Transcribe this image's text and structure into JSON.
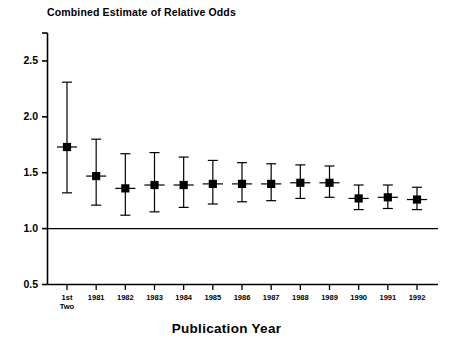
{
  "chart_data": {
    "type": "scatter",
    "title": "Combined Estimate of Relative Odds",
    "xlabel": "Publication Year",
    "ylabel": "",
    "categories": [
      "1st\nTwo",
      "1981",
      "1982",
      "1983",
      "1984",
      "1985",
      "1986",
      "1987",
      "1988",
      "1989",
      "1990",
      "1991",
      "1992"
    ],
    "category_labels": [
      {
        "line1": "1st",
        "line2": "Two"
      },
      {
        "line1": "1981",
        "line2": ""
      },
      {
        "line1": "1982",
        "line2": ""
      },
      {
        "line1": "1983",
        "line2": ""
      },
      {
        "line1": "1984",
        "line2": ""
      },
      {
        "line1": "1985",
        "line2": ""
      },
      {
        "line1": "1986",
        "line2": ""
      },
      {
        "line1": "1987",
        "line2": ""
      },
      {
        "line1": "1988",
        "line2": ""
      },
      {
        "line1": "1989",
        "line2": ""
      },
      {
        "line1": "1990",
        "line2": ""
      },
      {
        "line1": "1991",
        "line2": ""
      },
      {
        "line1": "1992",
        "line2": ""
      }
    ],
    "values": [
      1.73,
      1.47,
      1.36,
      1.39,
      1.39,
      1.4,
      1.4,
      1.4,
      1.41,
      1.41,
      1.27,
      1.28,
      1.26
    ],
    "error_low": [
      1.32,
      1.21,
      1.12,
      1.15,
      1.19,
      1.22,
      1.24,
      1.25,
      1.27,
      1.28,
      1.17,
      1.18,
      1.17
    ],
    "error_high": [
      2.31,
      1.8,
      1.67,
      1.68,
      1.64,
      1.61,
      1.59,
      1.58,
      1.57,
      1.56,
      1.39,
      1.39,
      1.37
    ],
    "ylim": [
      0.5,
      2.75
    ],
    "yticks": [
      0.5,
      1.0,
      1.5,
      2.0,
      2.5
    ],
    "ytick_labels": [
      "0.5",
      "1.0",
      "1.5",
      "2.0",
      "2.5"
    ],
    "reference_line": 1.0,
    "grid": false,
    "legend": null,
    "marker": "filled-square",
    "series_color": "#000000"
  }
}
